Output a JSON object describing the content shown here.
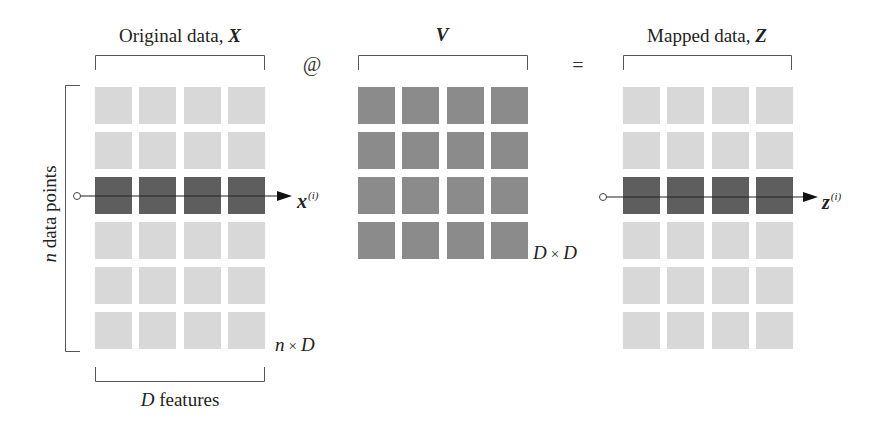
{
  "colors": {
    "light_cell": "#d8d8d8",
    "dark_cell": "#5e5e5e",
    "v_cell": "#8b8b8b",
    "line": "#555555"
  },
  "operators": {
    "matmul": "@",
    "equals": "="
  },
  "matrix_x": {
    "title_text": "Original data, ",
    "symbol": "X",
    "rows": 6,
    "cols": 4,
    "highlight_row": 2,
    "dim_n": "n",
    "dim_times": "×",
    "dim_d": "D",
    "row_axis_var": "n",
    "row_axis_text": " data points",
    "col_axis_var": "D",
    "col_axis_text": " features",
    "row_vector": "x",
    "row_vector_sup": "(i)"
  },
  "matrix_v": {
    "symbol": "V",
    "rows": 4,
    "cols": 4,
    "dim_d1": "D",
    "dim_times": "×",
    "dim_d2": "D"
  },
  "matrix_z": {
    "title_text": "Mapped data, ",
    "symbol": "Z",
    "rows": 6,
    "cols": 4,
    "highlight_row": 2,
    "row_vector": "z",
    "row_vector_sup": "(i)"
  }
}
